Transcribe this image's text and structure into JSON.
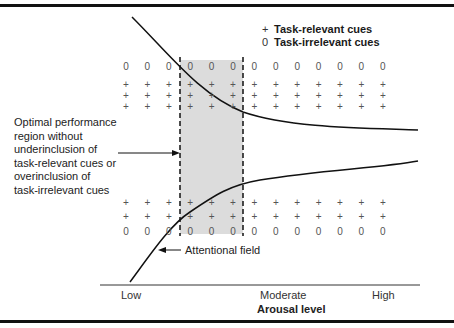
{
  "legend": {
    "items": [
      {
        "symbol": "+",
        "label": "Task-relevant cues"
      },
      {
        "symbol": "0",
        "label": "Task-irrelevant cues"
      }
    ]
  },
  "annotations": {
    "optimal_region": "Optimal performance region without underinclusion of task-relevant cues or overinclusion of task-irrelevant cues",
    "optimal_region_lines": [
      "Optimal performance",
      "region without",
      "underinclusion of",
      "task-relevant cues or",
      "overinclusion of",
      "task-irrelevant cues"
    ],
    "attentional_field": "Attentional field"
  },
  "x_axis": {
    "title": "Arousal level",
    "ticks": [
      "Low",
      "Moderate",
      "High"
    ]
  },
  "grid": {
    "columns": 13,
    "top_rows": [
      "0",
      "+",
      "+",
      "+"
    ],
    "bottom_rows": [
      "+",
      "+",
      "0"
    ]
  },
  "colors": {
    "shaded_region": "#dcdcdc",
    "lines": "#111111",
    "symbols": "#555555"
  }
}
